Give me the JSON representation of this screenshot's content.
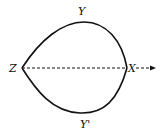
{
  "diagram": {
    "labels": {
      "top": "Y",
      "bottom": "Y'",
      "left": "Z",
      "right": "X"
    },
    "colors": {
      "stroke": "#111111",
      "background": "#ffffff"
    }
  }
}
